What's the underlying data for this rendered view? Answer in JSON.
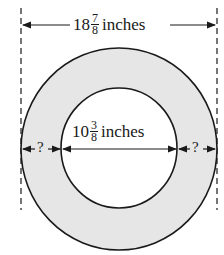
{
  "diagram": {
    "type": "annulus-dimension",
    "outer_diameter": {
      "whole": "18",
      "numerator": "7",
      "denominator": "8",
      "unit": "inches"
    },
    "inner_diameter": {
      "whole": "10",
      "numerator": "3",
      "denominator": "8",
      "unit": "inches"
    },
    "unknown_left": "?",
    "unknown_right": "?",
    "colors": {
      "ring_fill": "#e6e6e6",
      "stroke": "#1a1a1a",
      "background": "#ffffff"
    }
  }
}
